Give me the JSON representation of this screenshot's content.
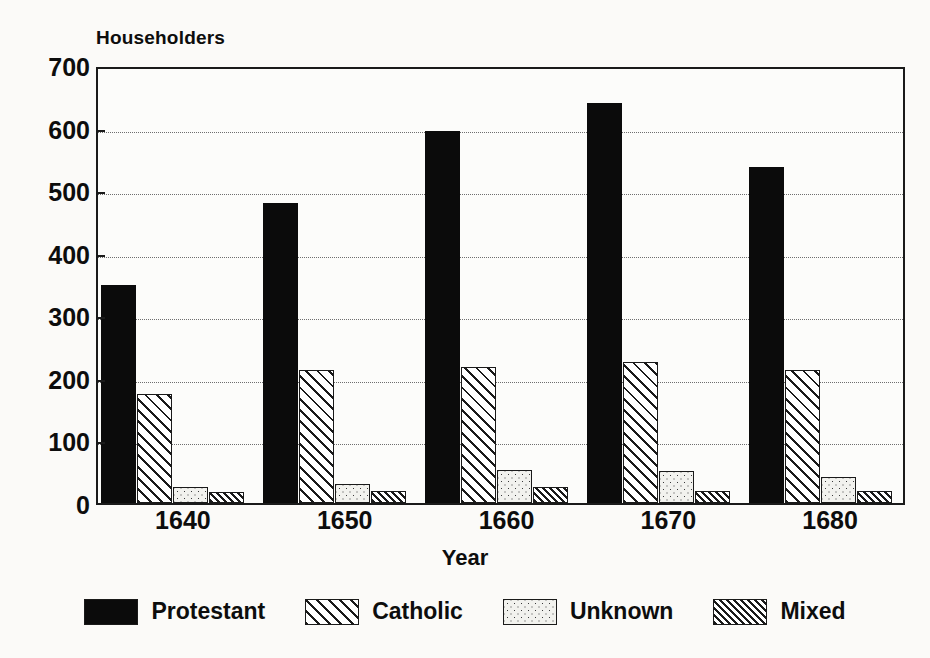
{
  "chart_data": {
    "type": "bar",
    "title": "",
    "ylabel": "Householders",
    "xlabel": "Year",
    "categories": [
      "1640",
      "1650",
      "1660",
      "1670",
      "1680"
    ],
    "series": [
      {
        "name": "Protestant",
        "pattern": "solid-black",
        "values": [
          348,
          480,
          595,
          640,
          537
        ]
      },
      {
        "name": "Catholic",
        "pattern": "diagonal-hatch",
        "values": [
          175,
          213,
          218,
          225,
          213
        ]
      },
      {
        "name": "Unknown",
        "pattern": "dotted-stipple",
        "values": [
          25,
          31,
          53,
          51,
          42
        ]
      },
      {
        "name": "Mixed",
        "pattern": "dense-diagonal-hatch",
        "values": [
          18,
          20,
          25,
          19,
          19
        ]
      }
    ],
    "ylim": [
      0,
      700
    ],
    "ytick_step": 100,
    "yticks": [
      "700",
      "600",
      "500",
      "400",
      "300",
      "200",
      "100",
      "0"
    ],
    "grid": true,
    "legend_position": "bottom"
  },
  "legend": {
    "items": [
      {
        "label": "Protestant"
      },
      {
        "label": "Catholic"
      },
      {
        "label": "Unknown"
      },
      {
        "label": "Mixed"
      }
    ]
  },
  "colors": {
    "background": "#fbfaf8",
    "plot_background": "#fcfcfa",
    "axis": "#1a1a1a",
    "gridline": "#6e6e6e",
    "text": "#0d0d0d",
    "protestant": "#0b0b0b"
  }
}
